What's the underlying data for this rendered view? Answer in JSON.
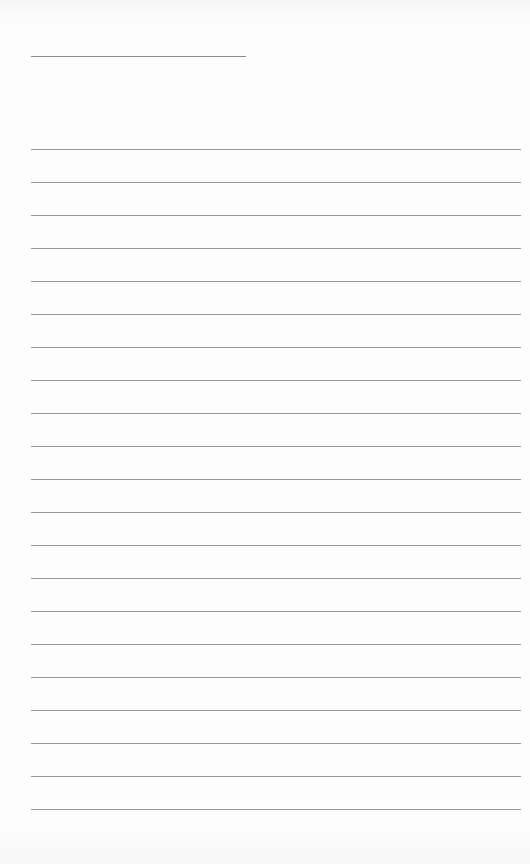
{
  "document": {
    "type": "lined-paper",
    "title_field": "",
    "rule_count": 21,
    "colors": {
      "paper": "#fdfdfd",
      "rule": "#9a9a9a"
    },
    "lines": [
      "",
      "",
      "",
      "",
      "",
      "",
      "",
      "",
      "",
      "",
      "",
      "",
      "",
      "",
      "",
      "",
      "",
      "",
      "",
      "",
      ""
    ]
  }
}
